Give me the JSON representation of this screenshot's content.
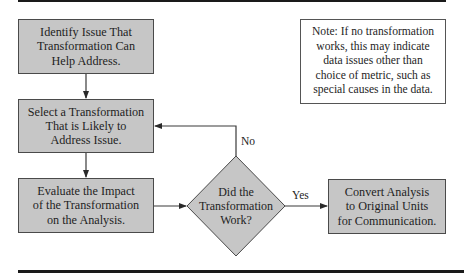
{
  "diagram": {
    "type": "flowchart",
    "nodes": {
      "identify": {
        "label": "Identify Issue That\nTransformation Can\nHelp Address."
      },
      "select": {
        "label": "Select a Transformation\nThat is Likely to\nAddress Issue."
      },
      "evaluate": {
        "label": "Evaluate the Impact\nof the Transformation\non the Analysis."
      },
      "decision": {
        "label": "Did the\nTransformation\nWork?"
      },
      "convert": {
        "label": "Convert Analysis\nto Original Units\nfor Communication."
      }
    },
    "edges": {
      "no_label": "No",
      "yes_label": "Yes"
    },
    "note": "Note: If no transformation\nworks, this may indicate\ndata issues other than\nchoice of metric, such as\nspecial causes in the data."
  },
  "colors": {
    "box_fill": "#c6c6c6",
    "line": "#3a3a3a",
    "rule": "#1a1a1a"
  }
}
